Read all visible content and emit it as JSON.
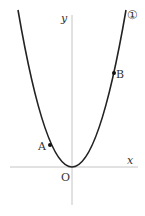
{
  "figure": {
    "curve_label": "①",
    "axes": {
      "x_label": "x",
      "y_label": "y",
      "origin_label": "O"
    },
    "points": [
      {
        "name": "A",
        "label": "A"
      },
      {
        "name": "B",
        "label": "B"
      }
    ],
    "colors": {
      "curve": "#222222",
      "axis": "#bbbbbb",
      "text": "#333333"
    }
  }
}
